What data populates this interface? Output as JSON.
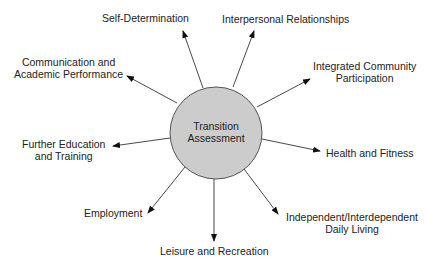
{
  "diagram": {
    "center": {
      "line1": "Transition",
      "line2": "Assessment",
      "fill": "#cccccc"
    },
    "nodes": [
      {
        "id": "self-determination",
        "lines": [
          "Self-Determination"
        ]
      },
      {
        "id": "interpersonal-relationships",
        "lines": [
          "Interpersonal Relationships"
        ]
      },
      {
        "id": "integrated-community-participation",
        "lines": [
          "Integrated Community",
          "Participation"
        ]
      },
      {
        "id": "health-and-fitness",
        "lines": [
          "Health and Fitness"
        ]
      },
      {
        "id": "independent-interdependent-daily-living",
        "lines": [
          "Independent/Interdependent",
          "Daily Living"
        ]
      },
      {
        "id": "leisure-and-recreation",
        "lines": [
          "Leisure and Recreation"
        ]
      },
      {
        "id": "employment",
        "lines": [
          "Employment"
        ]
      },
      {
        "id": "further-education-and-training",
        "lines": [
          "Further Education",
          "and Training"
        ]
      },
      {
        "id": "communication-and-academic-performance",
        "lines": [
          "Communication and",
          "Academic Performance"
        ]
      }
    ]
  }
}
